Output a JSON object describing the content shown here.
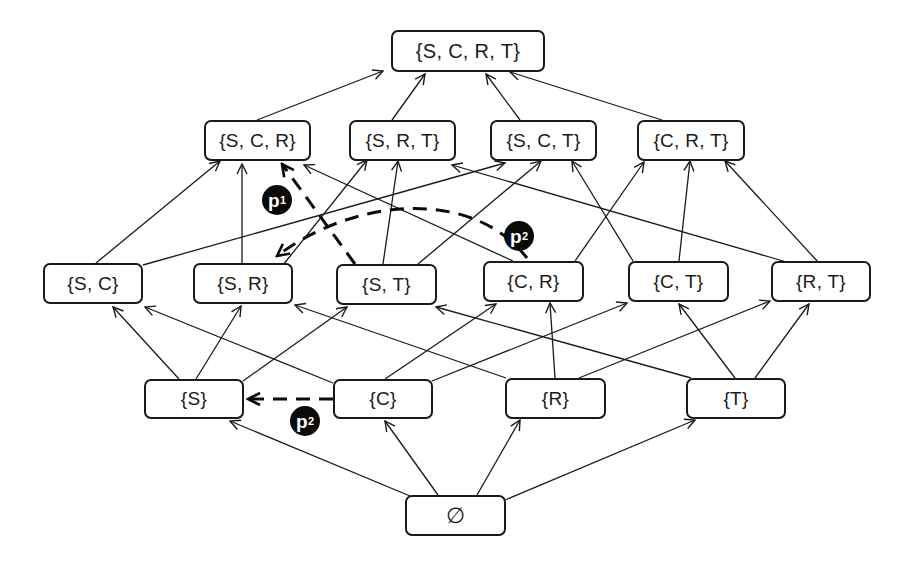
{
  "diagram": {
    "type": "lattice / Hasse diagram (power set of {S, C, R, T})",
    "nodes": [
      {
        "id": "SCRT",
        "label": "{S, C, R, T}",
        "x": 391,
        "y": 30,
        "w": 154,
        "h": 42
      },
      {
        "id": "SCR",
        "label": "{S, C, R}",
        "x": 204,
        "y": 120,
        "w": 107,
        "h": 41
      },
      {
        "id": "SRT",
        "label": "{S, R, T}",
        "x": 349,
        "y": 120,
        "w": 107,
        "h": 41
      },
      {
        "id": "SCT",
        "label": "{S, C, T}",
        "x": 490,
        "y": 120,
        "w": 107,
        "h": 41
      },
      {
        "id": "CRT",
        "label": "{C, R, T}",
        "x": 637,
        "y": 120,
        "w": 108,
        "h": 41
      },
      {
        "id": "SC",
        "label": "{S, C}",
        "x": 43,
        "y": 263,
        "w": 100,
        "h": 41
      },
      {
        "id": "SR",
        "label": "{S, R}",
        "x": 193,
        "y": 263,
        "w": 100,
        "h": 41
      },
      {
        "id": "ST",
        "label": "{S, T}",
        "x": 336,
        "y": 264,
        "w": 101,
        "h": 41
      },
      {
        "id": "CR",
        "label": "{C, R}",
        "x": 483,
        "y": 261,
        "w": 101,
        "h": 41
      },
      {
        "id": "CT",
        "label": "{C, T}",
        "x": 628,
        "y": 261,
        "w": 101,
        "h": 41
      },
      {
        "id": "RT",
        "label": "{R, T}",
        "x": 771,
        "y": 261,
        "w": 100,
        "h": 41
      },
      {
        "id": "S",
        "label": "{S}",
        "x": 144,
        "y": 379,
        "w": 100,
        "h": 40
      },
      {
        "id": "C",
        "label": "{C}",
        "x": 333,
        "y": 379,
        "w": 100,
        "h": 40
      },
      {
        "id": "R",
        "label": "{R}",
        "x": 505,
        "y": 378,
        "w": 101,
        "h": 41
      },
      {
        "id": "T",
        "label": "{T}",
        "x": 686,
        "y": 378,
        "w": 100,
        "h": 41
      },
      {
        "id": "EMPTY",
        "label": "∅",
        "x": 405,
        "y": 495,
        "w": 101,
        "h": 41
      }
    ],
    "edges": [
      {
        "from": "SCR",
        "to": "SCRT",
        "x1": 257,
        "y1": 120,
        "x2": 383,
        "y2": 71
      },
      {
        "from": "SRT",
        "to": "SCRT",
        "x1": 392,
        "y1": 120,
        "x2": 425,
        "y2": 74
      },
      {
        "from": "SCT",
        "to": "SCRT",
        "x1": 520,
        "y1": 120,
        "x2": 486,
        "y2": 74
      },
      {
        "from": "CRT",
        "to": "SCRT",
        "x1": 662,
        "y1": 120,
        "x2": 510,
        "y2": 72
      },
      {
        "from": "SC",
        "to": "SCR",
        "x1": 96,
        "y1": 263,
        "x2": 220,
        "y2": 161
      },
      {
        "from": "SC",
        "to": "SCT",
        "x1": 143,
        "y1": 265,
        "x2": 505,
        "y2": 163
      },
      {
        "from": "SR",
        "to": "SCR",
        "x1": 242,
        "y1": 263,
        "x2": 242,
        "y2": 164
      },
      {
        "from": "SR",
        "to": "SRT",
        "x1": 283,
        "y1": 265,
        "x2": 367,
        "y2": 160
      },
      {
        "from": "ST",
        "to": "SRT",
        "x1": 383,
        "y1": 264,
        "x2": 398,
        "y2": 161
      },
      {
        "from": "ST",
        "to": "SCT",
        "x1": 418,
        "y1": 264,
        "x2": 541,
        "y2": 161
      },
      {
        "from": "CR",
        "to": "SCR",
        "x1": 513,
        "y1": 261,
        "x2": 304,
        "y2": 165
      },
      {
        "from": "CR",
        "to": "CRT",
        "x1": 575,
        "y1": 261,
        "x2": 644,
        "y2": 162
      },
      {
        "from": "CT",
        "to": "SCT",
        "x1": 633,
        "y1": 261,
        "x2": 572,
        "y2": 161
      },
      {
        "from": "CT",
        "to": "CRT",
        "x1": 679,
        "y1": 261,
        "x2": 690,
        "y2": 161
      },
      {
        "from": "RT",
        "to": "SRT",
        "x1": 790,
        "y1": 263,
        "x2": 452,
        "y2": 165
      },
      {
        "from": "RT",
        "to": "CRT",
        "x1": 819,
        "y1": 263,
        "x2": 725,
        "y2": 161
      },
      {
        "from": "S",
        "to": "SC",
        "x1": 179,
        "y1": 379,
        "x2": 113,
        "y2": 307
      },
      {
        "from": "S",
        "to": "SR",
        "x1": 196,
        "y1": 379,
        "x2": 241,
        "y2": 306
      },
      {
        "from": "S",
        "to": "ST",
        "x1": 243,
        "y1": 381,
        "x2": 347,
        "y2": 307
      },
      {
        "from": "C",
        "to": "SC",
        "x1": 333,
        "y1": 383,
        "x2": 145,
        "y2": 307
      },
      {
        "from": "C",
        "to": "CR",
        "x1": 385,
        "y1": 379,
        "x2": 496,
        "y2": 304
      },
      {
        "from": "C",
        "to": "CT",
        "x1": 432,
        "y1": 381,
        "x2": 627,
        "y2": 303
      },
      {
        "from": "R",
        "to": "SR",
        "x1": 506,
        "y1": 378,
        "x2": 295,
        "y2": 305
      },
      {
        "from": "R",
        "to": "CR",
        "x1": 555,
        "y1": 378,
        "x2": 550,
        "y2": 303
      },
      {
        "from": "R",
        "to": "RT",
        "x1": 579,
        "y1": 378,
        "x2": 770,
        "y2": 301
      },
      {
        "from": "T",
        "to": "ST",
        "x1": 691,
        "y1": 378,
        "x2": 436,
        "y2": 307
      },
      {
        "from": "T",
        "to": "CT",
        "x1": 735,
        "y1": 378,
        "x2": 679,
        "y2": 304
      },
      {
        "from": "T",
        "to": "RT",
        "x1": 755,
        "y1": 378,
        "x2": 809,
        "y2": 304
      },
      {
        "from": "EMPTY",
        "to": "S",
        "x1": 410,
        "y1": 496,
        "x2": 230,
        "y2": 421
      },
      {
        "from": "EMPTY",
        "to": "C",
        "x1": 438,
        "y1": 495,
        "x2": 385,
        "y2": 421
      },
      {
        "from": "EMPTY",
        "to": "R",
        "x1": 477,
        "y1": 495,
        "x2": 520,
        "y2": 420
      },
      {
        "from": "EMPTY",
        "to": "T",
        "x1": 505,
        "y1": 500,
        "x2": 695,
        "y2": 420
      }
    ],
    "paths": [
      {
        "id": "p1",
        "label": "p",
        "subscript": "1",
        "from": "ST",
        "to": "SCR",
        "d": "M 355 264 L 282 164",
        "badge": {
          "x": 262,
          "y": 185
        }
      },
      {
        "id": "p2a",
        "label": "p",
        "subscript": "2",
        "from": "CR",
        "to": "SR",
        "d": "M 527 258 C 470 185, 350 200, 277 256",
        "badge": {
          "x": 504,
          "y": 221
        }
      },
      {
        "id": "p2b",
        "label": "p",
        "subscript": "2",
        "from": "C",
        "to": "S",
        "d": "M 333 399 L 248 399",
        "badge": {
          "x": 290,
          "y": 406
        }
      }
    ],
    "colors": {
      "stroke": "#1a1a1a",
      "badge_bg": "#0a0a0a",
      "badge_text": "#ffffff",
      "background": "#ffffff"
    }
  }
}
